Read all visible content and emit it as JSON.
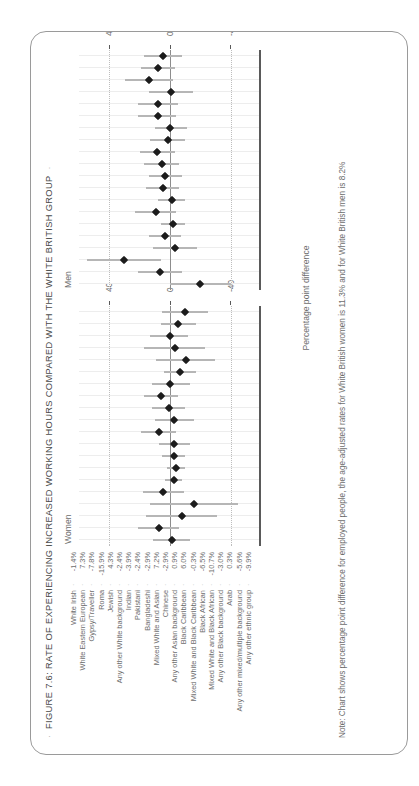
{
  "figure": {
    "title": "FIGURE 7.6: RATE OF EXPERIENCING INCREASED WORKING HOURS COMPARED WITH THE WHITE BRITISH GROUP",
    "lead_bullet": "·",
    "trail_bullet": "·",
    "note": "Note: Chart shows percentage point difference for employed people, the age-adjusted rates for White British women is 11.3% and for White British men is 8.2%",
    "xaxis_title": "Percentage point difference"
  },
  "chart_data": {
    "type": "scatter",
    "title": "FIGURE 7.6: RATE OF EXPERIENCING INCREASED WORKING HOURS COMPARED WITH THE WHITE BRITISH GROUP",
    "xlabel": "Percentage point difference",
    "ylabel": "",
    "xlim": [
      -60,
      60
    ],
    "xticks": [
      -40,
      0,
      40
    ],
    "xticklabels": [
      "-40",
      "0",
      "40"
    ],
    "grid": true,
    "legend_position": "none",
    "panels": [
      "Women",
      "Men"
    ],
    "categories": [
      "White Irish",
      "White Eastern European",
      "Gypsy/Traveller",
      "Roma",
      "Jewish",
      "Any other White background",
      "Indian",
      "Pakistani",
      "Bangladeshi",
      "Mixed White and Asian",
      "Chinese",
      "Any other Asian background",
      "Black Caribbean",
      "Mixed White and Black Caribbean",
      "Black African",
      "Mixed White and Black African",
      "Any other Black background",
      "Arab",
      "Any other mixed/multiple background",
      "Any other ethnic group"
    ],
    "series": [
      {
        "name": "Women",
        "values": [
          -1.4,
          7.3,
          -7.8,
          -15.9,
          4.3,
          -2.4,
          -3.9,
          -2.4,
          -2.9,
          7.2,
          -2.9,
          0.9,
          6.0,
          -0.3,
          -6.5,
          -10.7,
          -3.0,
          0.3,
          -5.6,
          -9.9
        ],
        "labels": [
          "-1.4%",
          "7.3%",
          "-7.8%",
          "-15.9%",
          "4.3%",
          "-2.4%",
          "-3.9%",
          "-2.4%",
          "-2.9%",
          "7.2%",
          "-2.9%",
          "0.9%",
          "6.0%",
          "-0.3%",
          "-6.5%",
          "-10.7%",
          "-3.0%",
          "0.3%",
          "-5.6%",
          "-9.9%"
        ],
        "ci_low": [
          -13,
          -6,
          -31,
          -45,
          -9,
          -8,
          -10,
          -10,
          -13,
          -4,
          -16,
          -10,
          -5,
          -13,
          -17,
          -30,
          -23,
          -12,
          -17,
          -25
        ],
        "ci_high": [
          11,
          21,
          16,
          13,
          18,
          3,
          2,
          5,
          7,
          19,
          10,
          12,
          17,
          12,
          4,
          9,
          17,
          13,
          6,
          5
        ]
      },
      {
        "name": "Men",
        "values": [
          -19.7,
          6.3,
          30.5,
          -3.5,
          3.4,
          -2.1,
          9.5,
          -1.1,
          4.7,
          3.0,
          5.4,
          8.6,
          1.6,
          -0.3,
          8.2,
          8.0,
          -0.6,
          13.9,
          8.0,
          4.7
        ],
        "labels": [
          "-19.7%",
          "6.3%",
          "30.5%",
          "-3.5%",
          "3.4%",
          "-2.1%",
          "9.5%",
          "-1.1%",
          "4.7%",
          "3.0%",
          "5.4%",
          "8.6%",
          "1.6%",
          "-0.3%",
          "8.2%",
          "8.0%",
          "-0.6%",
          "13.9%",
          "8.0%",
          "4.7%"
        ],
        "ci_low": [
          -40,
          -8,
          6,
          -18,
          -7,
          -10,
          -4,
          -10,
          -6,
          -8,
          -6,
          -3,
          -10,
          -11,
          -4,
          -5,
          -15,
          -2,
          -3,
          -8
        ],
        "ci_high": [
          0,
          21,
          55,
          11,
          14,
          6,
          23,
          8,
          16,
          14,
          17,
          20,
          13,
          10,
          21,
          21,
          14,
          30,
          19,
          17
        ]
      }
    ]
  }
}
